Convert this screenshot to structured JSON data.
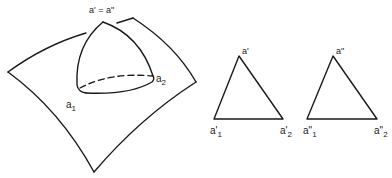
{
  "figure": {
    "stroke_color": "#1a1a1a",
    "background": "#ffffff",
    "left_panel": {
      "description": "Spherical triangle on a curved surface",
      "apex_label": "a' = a\"",
      "vertex1_label": "a",
      "vertex1_sub": "1",
      "vertex2_label": "a",
      "vertex2_sub": "2"
    },
    "middle_triangle": {
      "apex_label": "a'",
      "left_label": "a'",
      "left_sub": "1",
      "right_label": "a'",
      "right_sub": "2"
    },
    "right_triangle": {
      "apex_label": "a\"",
      "left_label": "a\"",
      "left_sub": "1",
      "right_label": "a\"",
      "right_sub": "2"
    }
  }
}
